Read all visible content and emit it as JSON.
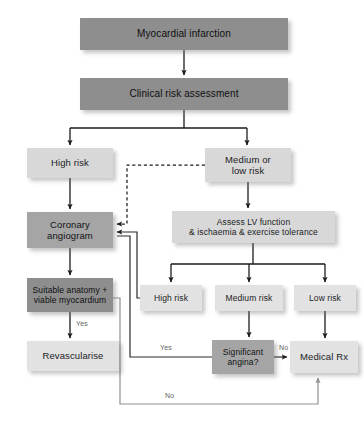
{
  "chart_data": {
    "type": "diagram",
    "nodes": [
      {
        "id": "mi",
        "label": "Myocardial infarction",
        "tone": "dark",
        "x": 80,
        "y": 18,
        "w": 208,
        "h": 32,
        "font": 10
      },
      {
        "id": "clinical",
        "label": "Clinical risk assessment",
        "tone": "dark",
        "x": 80,
        "y": 78,
        "w": 208,
        "h": 32,
        "font": 10
      },
      {
        "id": "highrisk1",
        "label": "High risk",
        "tone": "light",
        "x": 27,
        "y": 148,
        "w": 86,
        "h": 30,
        "font": 9.5
      },
      {
        "id": "medlow",
        "label": "Medium or\nlow risk",
        "tone": "light",
        "x": 205,
        "y": 148,
        "w": 86,
        "h": 34,
        "font": 9.5
      },
      {
        "id": "angio",
        "label": "Coronary\nangiogram",
        "tone": "mid",
        "x": 27,
        "y": 212,
        "w": 86,
        "h": 36,
        "font": 9.5
      },
      {
        "id": "assess",
        "label": "Assess LV function\n& ischaemia  & exercise tolerance",
        "tone": "light",
        "x": 172,
        "y": 211,
        "w": 163,
        "h": 32,
        "font": 8.5
      },
      {
        "id": "suitable",
        "label": "Suitable anatomy +\nviable myocardium",
        "tone": "dark",
        "x": 27,
        "y": 278,
        "w": 86,
        "h": 34,
        "font": 8.5
      },
      {
        "id": "highrisk2",
        "label": "High risk",
        "tone": "pale",
        "x": 140,
        "y": 285,
        "w": 62,
        "h": 26,
        "font": 8.5
      },
      {
        "id": "medrisk",
        "label": "Medium risk",
        "tone": "pale",
        "x": 215,
        "y": 285,
        "w": 68,
        "h": 26,
        "font": 8.5
      },
      {
        "id": "lowrisk",
        "label": "Low risk",
        "tone": "pale",
        "x": 294,
        "y": 285,
        "w": 62,
        "h": 26,
        "font": 8.5
      },
      {
        "id": "revasc",
        "label": "Revascularise",
        "tone": "pale",
        "x": 27,
        "y": 341,
        "w": 92,
        "h": 30,
        "font": 9.5
      },
      {
        "id": "angina",
        "label": "Significant\nangina?",
        "tone": "mid",
        "x": 212,
        "y": 340,
        "w": 62,
        "h": 34,
        "font": 8.5
      },
      {
        "id": "medrx",
        "label": "Medical Rx",
        "tone": "pale",
        "x": 290,
        "y": 341,
        "w": 68,
        "h": 32,
        "font": 9.5
      }
    ],
    "edge_labels": [
      {
        "id": "yes-revasc",
        "text": "Yes",
        "x": 76,
        "y": 320
      },
      {
        "id": "yes-angina",
        "text": "Yes",
        "x": 160,
        "y": 344
      },
      {
        "id": "no-angina",
        "text": "No",
        "x": 279,
        "y": 344
      },
      {
        "id": "no-loop",
        "text": "No",
        "x": 165,
        "y": 392
      }
    ],
    "edges": [
      {
        "from": "mi",
        "to": "clinical",
        "style": "solid"
      },
      {
        "from": "clinical",
        "to": "highrisk1",
        "style": "solid"
      },
      {
        "from": "clinical",
        "to": "medlow",
        "style": "solid"
      },
      {
        "from": "highrisk1",
        "to": "angio",
        "style": "solid"
      },
      {
        "from": "medlow",
        "to": "assess",
        "style": "solid"
      },
      {
        "from": "medlow",
        "to": "angio",
        "style": "dashed"
      },
      {
        "from": "angio",
        "to": "suitable",
        "style": "solid"
      },
      {
        "from": "assess",
        "to": "highrisk2",
        "style": "solid"
      },
      {
        "from": "assess",
        "to": "medrisk",
        "style": "solid"
      },
      {
        "from": "assess",
        "to": "lowrisk",
        "style": "solid"
      },
      {
        "from": "highrisk2",
        "to": "angio",
        "style": "solid"
      },
      {
        "from": "suitable",
        "to": "revasc",
        "style": "solid",
        "label": "Yes"
      },
      {
        "from": "suitable",
        "to": "angio",
        "style": "solid",
        "label": "No"
      },
      {
        "from": "medrisk",
        "to": "angina",
        "style": "solid"
      },
      {
        "from": "lowrisk",
        "to": "medrx",
        "style": "solid"
      },
      {
        "from": "angina",
        "to": "angio",
        "style": "solid",
        "label": "Yes"
      },
      {
        "from": "angina",
        "to": "medrx",
        "style": "solid",
        "label": "No"
      },
      {
        "from": "suitable",
        "to": "medrx",
        "style": "solid",
        "label": "No"
      }
    ],
    "colors": {
      "dark": "#8e8e8e",
      "mid": "#a5a5a5",
      "light": "#d8d8d8",
      "pale": "#e2e2e2",
      "arrow_dark": "#1d1d1d",
      "arrow_light": "#8d8f91",
      "background": "#ffffff"
    }
  }
}
